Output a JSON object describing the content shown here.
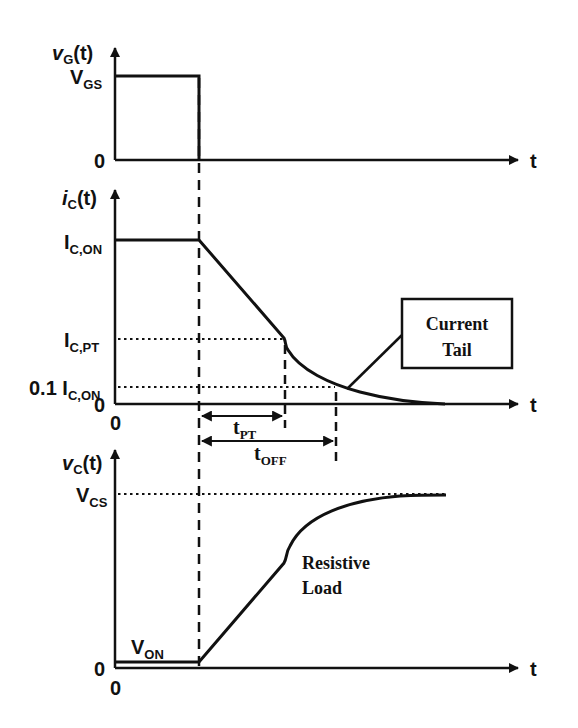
{
  "diagram": {
    "plots": [
      {
        "id": "gate-voltage",
        "y_label_main": "v",
        "y_label_sub": "G",
        "y_label_suffix": "(t)",
        "levels": [
          {
            "main": "V",
            "sub": "GS"
          }
        ],
        "zero_label": "0",
        "x_label": "t"
      },
      {
        "id": "collector-current",
        "y_label_main": "i",
        "y_label_sub": "C",
        "y_label_suffix": "(t)",
        "levels": [
          {
            "main": "I",
            "sub": "C,ON"
          },
          {
            "main": "I",
            "sub": "C,PT"
          },
          {
            "prefix": "0.1 ",
            "main": "I",
            "sub": "C,ON"
          }
        ],
        "zero_label": "0",
        "origin_label": "0",
        "x_label": "t",
        "intervals": [
          {
            "main": "t",
            "sub": "PT"
          },
          {
            "main": "t",
            "sub": "OFF"
          }
        ],
        "annotation": {
          "line1": "Current",
          "line2": "Tail"
        }
      },
      {
        "id": "collector-voltage",
        "y_label_main": "v",
        "y_label_sub": "C",
        "y_label_suffix": "(t)",
        "levels": [
          {
            "main": "V",
            "sub": "CS"
          },
          {
            "main": "V",
            "sub": "ON"
          }
        ],
        "zero_label": "0",
        "origin_label": "0",
        "x_label": "t",
        "annotation": {
          "line1": "Resistive",
          "line2": "Load"
        }
      }
    ]
  }
}
